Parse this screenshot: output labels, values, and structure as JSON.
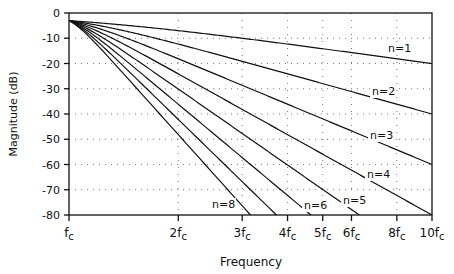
{
  "chart_data": {
    "type": "line",
    "title": "",
    "xlabel": "Frequency",
    "ylabel": "Magnitude (dB)",
    "x_scale": "log",
    "xlim_fc_multiples": [
      1,
      10
    ],
    "ylim": [
      -80,
      0
    ],
    "x_ticks": [
      {
        "value": 1,
        "label": "fc"
      },
      {
        "value": 2,
        "label": "2fc"
      },
      {
        "value": 3,
        "label": "3fc"
      },
      {
        "value": 4,
        "label": "4fc"
      },
      {
        "value": 5,
        "label": "5fc"
      },
      {
        "value": 6,
        "label": "6fc"
      },
      {
        "value": 8,
        "label": "8fc"
      },
      {
        "value": 10,
        "label": "10fc"
      }
    ],
    "y_ticks": [
      0,
      -10,
      -20,
      -30,
      -40,
      -50,
      -60,
      -70,
      -80
    ],
    "grid": "dotted",
    "series": [
      {
        "name": "n=1",
        "order": 1,
        "start_db": -3,
        "end": {
          "x": 10,
          "y": -20
        }
      },
      {
        "name": "n=2",
        "order": 2,
        "start_db": -3,
        "end": {
          "x": 10,
          "y": -40
        }
      },
      {
        "name": "n=3",
        "order": 3,
        "start_db": -3,
        "end": {
          "x": 10,
          "y": -60
        }
      },
      {
        "name": "n=4",
        "order": 4,
        "start_db": -3,
        "end": {
          "x": 10,
          "y": -80
        }
      },
      {
        "name": "n=5",
        "order": 5,
        "start_db": -3,
        "end": {
          "x": 6.3,
          "y": -80
        }
      },
      {
        "name": "n=6",
        "order": 6,
        "start_db": -3,
        "end": {
          "x": 4.6,
          "y": -80
        }
      },
      {
        "name": "n=7",
        "order": 7,
        "start_db": -3,
        "end": {
          "x": 3.7,
          "y": -80
        }
      },
      {
        "name": "n=8",
        "order": 8,
        "start_db": -3,
        "end": {
          "x": 3.16,
          "y": -80
        }
      }
    ],
    "annotations": [
      {
        "text": "n=1",
        "x_px": 388,
        "y_px": 52
      },
      {
        "text": "n=2",
        "x_px": 372,
        "y_px": 95
      },
      {
        "text": "n=3",
        "x_px": 370,
        "y_px": 139
      },
      {
        "text": "n=4",
        "x_px": 367,
        "y_px": 178
      },
      {
        "text": "n=5",
        "x_px": 343,
        "y_px": 204
      },
      {
        "text": "n=6",
        "x_px": 304,
        "y_px": 209
      },
      {
        "text": "n=8",
        "x_px": 212,
        "y_px": 208
      }
    ]
  }
}
